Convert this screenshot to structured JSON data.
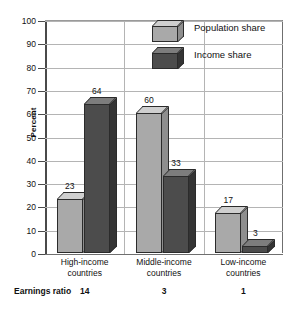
{
  "chart_data": {
    "type": "bar",
    "title": "",
    "subtitle": "",
    "xlabel": "",
    "ylabel": "Percent",
    "ylim": [
      0,
      100
    ],
    "ytick_labels": [
      "0",
      "10",
      "20",
      "30",
      "40",
      "50",
      "60",
      "70",
      "80",
      "90",
      "100"
    ],
    "ytick_values": [
      0,
      10,
      20,
      30,
      40,
      50,
      60,
      70,
      80,
      90,
      100
    ],
    "grid": true,
    "legend_position": "top-right",
    "categories": [
      "High-income countries",
      "Middle-income countries",
      "Low-income countries"
    ],
    "category_lines": [
      [
        "High-income",
        "countries"
      ],
      [
        "Middle-income",
        "countries"
      ],
      [
        "Low-income",
        "countries"
      ]
    ],
    "series": [
      {
        "name": "Population share",
        "values": [
          23,
          60,
          17
        ],
        "color": "#a9a9a9",
        "top_color": "#cfcfcf",
        "side_color": "#8e8e8e"
      },
      {
        "name": "Income share",
        "values": [
          64,
          33,
          3
        ],
        "color": "#4c4c4c",
        "top_color": "#7d7d7d",
        "side_color": "#343434"
      }
    ],
    "annotations": {
      "footer_label": "Earnings ratio",
      "footer_values": [
        "14",
        "3",
        "1"
      ]
    }
  },
  "legend": {
    "items": [
      {
        "label": "Population share"
      },
      {
        "label": "Income share"
      }
    ]
  },
  "colors": {
    "axis": "#4a4a4a",
    "grid": "#b4b4b4",
    "text": "#111111",
    "background": "#ffffff"
  }
}
